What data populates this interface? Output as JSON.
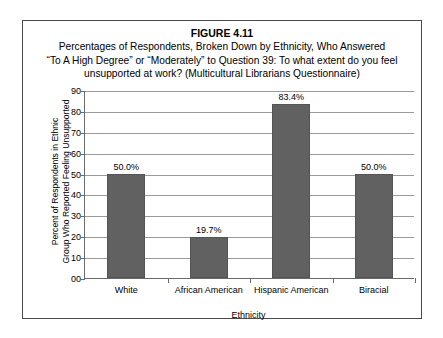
{
  "figure": {
    "number": "FIGURE 4.11",
    "title_lines": [
      "Percentages of Respondents, Broken Down by Ethnicity, Who Answered",
      "“To A High Degree” or “Moderately” to Question 39: To what extent do you feel",
      "unsupported at work? (Multicultural Librarians Questionnaire)"
    ]
  },
  "axis": {
    "y_title_line1": "Percent of Respondents in Ethnic",
    "y_title_line2": "Group Who Reported Feeling Unsupported",
    "x_title": "Ethnicity",
    "y_ticks": [
      "90",
      "80",
      "70",
      "60",
      "50",
      "40",
      "30",
      "20",
      "10",
      "00"
    ]
  },
  "colors": {
    "bar_fill": "#616161",
    "bar_stroke": "#545454",
    "gridline": "#9a9a9a",
    "axis": "#6b6b6b",
    "frame": "#4a4a4a",
    "text": "#000000"
  },
  "chart_data": {
    "type": "bar",
    "categories": [
      "White",
      "African American",
      "Hispanic American",
      "Biracial"
    ],
    "values": [
      50.0,
      19.7,
      83.4,
      50.0
    ],
    "data_labels": [
      "50.0%",
      "19.7%",
      "83.4%",
      "50.0%"
    ],
    "xlabel": "Ethnicity",
    "ylabel": "Percent of Respondents in Ethnic Group Who Reported Feeling Unsupported",
    "ylim": [
      0,
      90
    ],
    "ytick_step": 10,
    "ytick_labels": [
      "00",
      "10",
      "20",
      "30",
      "40",
      "50",
      "60",
      "70",
      "80",
      "90"
    ],
    "grid": true,
    "legend": false
  }
}
